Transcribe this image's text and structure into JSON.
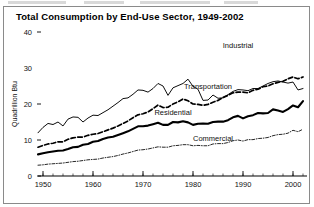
{
  "chart_data": {
    "type": "line",
    "title": "Total Consumption by End-Use Sector, 1949-2002",
    "xlabel": "",
    "ylabel": "Quadrillion Btu",
    "xlim": [
      1949,
      2002
    ],
    "ylim": [
      0,
      42
    ],
    "xticks": [
      1950,
      1960,
      1970,
      1980,
      1990,
      2000
    ],
    "xticklabels": [
      "1950",
      "1960",
      "1970",
      "1980",
      "1990",
      "2000"
    ],
    "yticks": [
      0,
      10,
      20,
      30,
      40
    ],
    "yticklabels": [
      "0",
      "10",
      "20",
      "30",
      "40"
    ],
    "grid": false,
    "legend_position": "inline-annotations",
    "minor_tick_interval_years": 2,
    "x": [
      1949,
      1950,
      1951,
      1952,
      1953,
      1954,
      1955,
      1956,
      1957,
      1958,
      1959,
      1960,
      1961,
      1962,
      1963,
      1964,
      1965,
      1966,
      1967,
      1968,
      1969,
      1970,
      1971,
      1972,
      1973,
      1974,
      1975,
      1976,
      1977,
      1978,
      1979,
      1980,
      1981,
      1982,
      1983,
      1984,
      1985,
      1986,
      1987,
      1988,
      1989,
      1990,
      1991,
      1992,
      1993,
      1994,
      1995,
      1996,
      1997,
      1998,
      1999,
      2000,
      2001,
      2002
    ],
    "series": [
      {
        "name": "Industrial",
        "style": "solid-thin",
        "label_x": 1989,
        "label_y": 35.6,
        "values": [
          12.0,
          13.5,
          14.6,
          14.3,
          15.0,
          13.9,
          15.8,
          16.4,
          16.3,
          15.0,
          16.1,
          16.9,
          16.8,
          17.6,
          18.4,
          19.4,
          20.4,
          21.5,
          21.7,
          22.7,
          23.9,
          23.8,
          23.3,
          24.3,
          25.7,
          25.0,
          22.4,
          24.5,
          25.1,
          25.7,
          26.9,
          24.9,
          24.1,
          21.0,
          21.1,
          22.5,
          21.6,
          21.7,
          22.6,
          23.5,
          24.0,
          23.9,
          23.7,
          24.3,
          24.3,
          25.0,
          25.7,
          26.2,
          26.4,
          26.1,
          25.8,
          26.1,
          23.9,
          24.3
        ],
        "_render_values_note": "plotted as drawn in figure"
      },
      {
        "name": "Transportation",
        "style": "dashed",
        "label_x": 1983,
        "label_y": 24.2,
        "values": [
          8.0,
          8.5,
          8.9,
          9.1,
          9.5,
          9.5,
          10.2,
          10.6,
          10.8,
          10.8,
          11.3,
          11.6,
          11.8,
          12.3,
          12.8,
          13.3,
          13.9,
          14.6,
          15.3,
          16.2,
          17.0,
          17.3,
          17.8,
          18.7,
          19.7,
          19.0,
          19.1,
          20.0,
          20.6,
          21.4,
          20.9,
          20.0,
          19.9,
          19.6,
          19.9,
          20.5,
          21.0,
          21.8,
          22.4,
          23.1,
          23.3,
          23.3,
          23.1,
          23.8,
          24.1,
          24.8,
          25.0,
          25.6,
          26.0,
          26.3,
          27.0,
          27.5,
          27.0,
          27.5
        ]
      },
      {
        "name": "Residential",
        "style": "solid-thick",
        "label_x": 1976,
        "label_y": 17.0,
        "values": [
          6.0,
          6.3,
          6.6,
          6.8,
          7.0,
          7.1,
          7.5,
          8.0,
          8.1,
          8.7,
          8.9,
          9.5,
          9.7,
          10.3,
          10.7,
          10.9,
          11.4,
          11.9,
          12.4,
          13.1,
          13.8,
          13.8,
          14.0,
          14.4,
          14.8,
          14.2,
          14.2,
          15.0,
          14.9,
          15.2,
          14.9,
          14.2,
          14.5,
          14.6,
          14.5,
          15.0,
          15.1,
          15.1,
          15.5,
          16.3,
          16.7,
          16.0,
          16.6,
          16.9,
          17.5,
          17.4,
          17.5,
          18.5,
          18.2,
          17.8,
          18.6,
          19.6,
          19.1,
          20.8
        ]
      },
      {
        "name": "Commercial",
        "style": "dash-dot",
        "label_x": 1984,
        "label_y": 9.8,
        "values": [
          3.0,
          3.1,
          3.3,
          3.4,
          3.5,
          3.6,
          3.8,
          4.0,
          4.1,
          4.3,
          4.5,
          4.6,
          4.7,
          5.0,
          5.2,
          5.4,
          5.7,
          6.1,
          6.4,
          6.8,
          7.2,
          7.3,
          7.5,
          7.8,
          8.1,
          8.0,
          8.0,
          8.4,
          8.5,
          8.7,
          8.7,
          8.4,
          8.5,
          8.4,
          8.4,
          8.9,
          9.0,
          9.0,
          9.3,
          9.8,
          10.0,
          9.7,
          10.1,
          10.1,
          10.4,
          10.5,
          10.7,
          11.2,
          11.5,
          11.6,
          11.9,
          12.7,
          12.3,
          13.0
        ]
      }
    ]
  }
}
